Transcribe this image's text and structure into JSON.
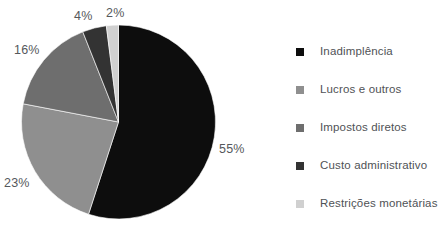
{
  "chart_data": {
    "type": "pie",
    "title": "",
    "subtitle": "",
    "xlabel": "",
    "ylabel": "",
    "grid": false,
    "legend_position": "right",
    "units": "percent",
    "start_angle_deg": 0,
    "direction": "clockwise",
    "labels": [
      "Inadimplência",
      "Lucros e outros",
      "Impostos diretos",
      "Custo administrativo",
      "Restrições monetárias"
    ],
    "values": [
      55,
      23,
      16,
      4,
      2
    ],
    "value_labels": [
      "55%",
      "23%",
      "16%",
      "4%",
      "2%"
    ],
    "colors": [
      "#0d0d0d",
      "#8f8f8f",
      "#6e6e6e",
      "#333333",
      "#d0d0d0"
    ],
    "slices": [
      {
        "label": "Inadimplência",
        "value": 55,
        "value_label": "55%",
        "color": "#0d0d0d"
      },
      {
        "label": "Lucros e outros",
        "value": 23,
        "value_label": "23%",
        "color": "#8f8f8f"
      },
      {
        "label": "Impostos diretos",
        "value": 16,
        "value_label": "16%",
        "color": "#6e6e6e"
      },
      {
        "label": "Custo administrativo",
        "value": 4,
        "value_label": "4%",
        "color": "#333333"
      },
      {
        "label": "Restrições monetárias",
        "value": 2,
        "value_label": "2%",
        "color": "#d0d0d0"
      }
    ]
  },
  "legend": {
    "items": [
      {
        "label": "Inadimplência",
        "color": "#0d0d0d"
      },
      {
        "label": "Lucros e outros",
        "color": "#8f8f8f"
      },
      {
        "label": "Impostos diretos",
        "color": "#6e6e6e"
      },
      {
        "label": "Custo administrativo",
        "color": "#333333"
      },
      {
        "label": "Restrições monetárias",
        "color": "#d0d0d0"
      }
    ]
  },
  "geometry": {
    "center_x": 118.5,
    "center_y": 122,
    "radius": 97
  }
}
